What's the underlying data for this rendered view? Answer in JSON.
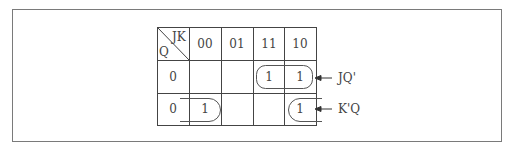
{
  "kmap": {
    "corner": {
      "col_var": "JK",
      "row_var": "Q"
    },
    "columns": [
      "00",
      "01",
      "11",
      "10"
    ],
    "rows": [
      {
        "label": "0",
        "cells": [
          "",
          "",
          "1",
          "1"
        ]
      },
      {
        "label": "0",
        "cells": [
          "1",
          "",
          "",
          "1"
        ]
      }
    ],
    "groups": [
      {
        "name": "JQ'",
        "label": "JQ'",
        "description": "row 0, columns 11 and 10"
      },
      {
        "name": "K'Q",
        "label": "K'Q",
        "description": "row 1, columns 00 and 10 (wrap-around)"
      }
    ]
  }
}
